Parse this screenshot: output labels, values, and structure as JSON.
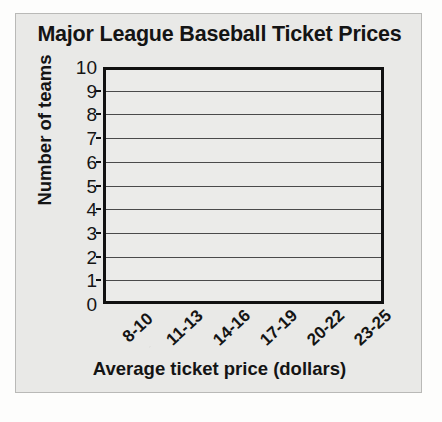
{
  "figure": {
    "title": "Major League Baseball Ticket Prices",
    "background_color": "#e9e9e7",
    "border_color": "#b9b9b7",
    "axis_color": "#111111",
    "gridline_color": "#4a4a4a"
  },
  "chart_data": {
    "type": "bar",
    "title": "Major League Baseball Ticket Prices",
    "xlabel": "Average ticket price (dollars)",
    "ylabel": "Number of teams",
    "categories": [
      "8-10",
      "11-13",
      "14-16",
      "17-19",
      "20-22",
      "23-25"
    ],
    "values": [
      null,
      null,
      null,
      null,
      null,
      null
    ],
    "ylim": [
      0,
      10
    ],
    "ytick_labels": [
      "10",
      "9",
      "8",
      "7",
      "6",
      "5",
      "4",
      "3",
      "2",
      "1",
      "0"
    ],
    "ytick_values": [
      10,
      9,
      8,
      7,
      6,
      5,
      4,
      3,
      2,
      1,
      0
    ],
    "gridlines": [
      1,
      2,
      3,
      4,
      5,
      6,
      7,
      8,
      9
    ],
    "grid": true,
    "grid_orientation": "horizontal",
    "legend": null,
    "legend_position": "none",
    "annotations": [],
    "note": "Empty grid template: axes and gridlines drawn, no bars plotted"
  }
}
